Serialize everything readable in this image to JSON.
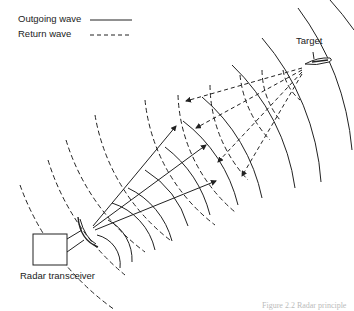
{
  "legend": {
    "outgoing": {
      "label": "Outgoing wave",
      "style": "solid"
    },
    "return": {
      "label": "Return wave",
      "style": "dashed"
    }
  },
  "labels": {
    "target": "Target",
    "transceiver": "Radar transceiver"
  },
  "caption": "Figure 2.2  Radar principle",
  "colors": {
    "line": "#222222",
    "background": "#ffffff"
  }
}
